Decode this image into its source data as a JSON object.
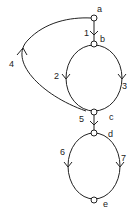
{
  "nodes": {
    "a": "a",
    "b": "b",
    "c": "c",
    "d": "d",
    "e": "e"
  },
  "edges": {
    "e1": "1",
    "e2": "2",
    "e3": "3",
    "e4": "4",
    "e5": "5",
    "e6": "6",
    "e7": "7"
  }
}
